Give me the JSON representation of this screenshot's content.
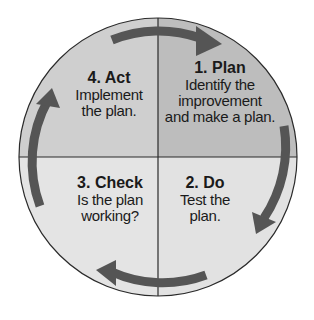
{
  "colors": {
    "plan_fill": "#bdbdbd",
    "act_fill": "#cfcfcf",
    "check_fill": "#e4e4e4",
    "do_fill": "#e2e2e2",
    "outline": "#2a2a2a",
    "arrow": "#555555",
    "text": "#1a1a1a"
  },
  "quadrants": [
    {
      "id": "plan",
      "title": "1. Plan",
      "lines": [
        "Identify the",
        "improvement",
        "and make a plan."
      ]
    },
    {
      "id": "do",
      "title": "2. Do",
      "lines": [
        "Test the",
        "plan."
      ]
    },
    {
      "id": "check",
      "title": "3. Check",
      "lines": [
        "Is the plan",
        "working?"
      ]
    },
    {
      "id": "act",
      "title": "4. Act",
      "lines": [
        "Implement",
        "the plan."
      ]
    }
  ],
  "arrows": [
    {
      "from": "act",
      "to": "plan",
      "direction": "clockwise"
    },
    {
      "from": "plan",
      "to": "do",
      "direction": "clockwise"
    },
    {
      "from": "do",
      "to": "check",
      "direction": "clockwise"
    },
    {
      "from": "check",
      "to": "act",
      "direction": "clockwise"
    }
  ]
}
